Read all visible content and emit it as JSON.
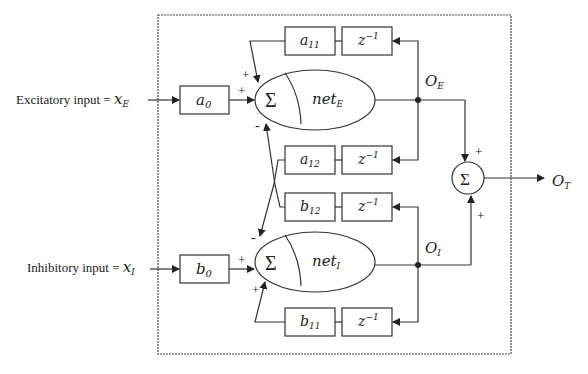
{
  "diagram": {
    "type": "block-diagram",
    "inputs": {
      "excitatory": {
        "label": "Excitatory input = ",
        "symbol": "x",
        "sub": "E"
      },
      "inhibitory": {
        "label": "Inhibitory input = ",
        "symbol": "x",
        "sub": "I"
      }
    },
    "blocks": {
      "a0": {
        "sym": "a",
        "sub": "0"
      },
      "b0": {
        "sym": "b",
        "sub": "0"
      },
      "a11": {
        "sym": "a",
        "sub": "11"
      },
      "a12": {
        "sym": "a",
        "sub": "12"
      },
      "b12": {
        "sym": "b",
        "sub": "12"
      },
      "b11": {
        "sym": "b",
        "sub": "11"
      },
      "delay": {
        "sym": "z",
        "sup": "−1"
      }
    },
    "summers": {
      "sigma": "Σ",
      "netE": {
        "sym": "net",
        "sub": "E"
      },
      "netI": {
        "sym": "net",
        "sub": "I"
      }
    },
    "outputs": {
      "OE": {
        "sym": "O",
        "sub": "E"
      },
      "OI": {
        "sym": "O",
        "sub": "I"
      },
      "OT": {
        "sym": "O",
        "sub": "T"
      }
    },
    "signs": {
      "plus": "+",
      "minus": "-"
    }
  }
}
